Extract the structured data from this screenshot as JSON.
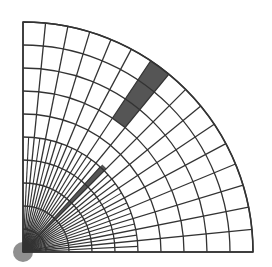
{
  "diagram": {
    "type": "quarter-circle polar mesh",
    "origin": [
      23,
      252
    ],
    "outer_radius": 230,
    "ring_count": 10,
    "outer_sector_count": 16,
    "inner_sector_count": 32,
    "inner_refined_radius": 115,
    "colors": {
      "background": "#ffffff",
      "grid_line": "#333333",
      "shaded_cell": "#555555"
    },
    "shaded_regions": [
      {
        "name": "upper-shaded-band",
        "ring_start": 7,
        "ring_end": 10,
        "sector_start_deg": 50.625,
        "sector_end_deg": 56.25
      },
      {
        "name": "lower-shaded-band",
        "radius_start": 12,
        "radius_end": 118,
        "sector_start_deg": 45.0,
        "sector_end_deg": 47.8125
      }
    ]
  }
}
